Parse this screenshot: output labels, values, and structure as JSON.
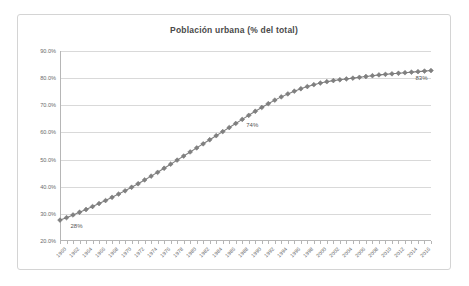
{
  "chart": {
    "title": "Población urbana (% del total)",
    "accent_color": "#808080",
    "gridline_color": "#d9d9d9",
    "frame_color": "#d4d4d4"
  },
  "chart_data": {
    "type": "line",
    "title": "Población urbana (% del total)",
    "xlabel": "",
    "ylabel": "",
    "ylim": [
      20,
      90
    ],
    "ytick_labels": [
      "20.0%",
      "30.0%",
      "40.0%",
      "50.0%",
      "60.0%",
      "70.0%",
      "80.0%",
      "90.0%"
    ],
    "ytick_values": [
      20,
      30,
      40,
      50,
      60,
      70,
      80,
      90
    ],
    "grid": true,
    "legend": "none",
    "marker": "diamond",
    "series_color": "#808080",
    "x": [
      1960,
      1961,
      1962,
      1963,
      1964,
      1965,
      1966,
      1967,
      1968,
      1969,
      1970,
      1971,
      1972,
      1973,
      1974,
      1975,
      1976,
      1977,
      1978,
      1979,
      1980,
      1981,
      1982,
      1983,
      1984,
      1985,
      1986,
      1987,
      1988,
      1989,
      1990,
      1991,
      1992,
      1993,
      1994,
      1995,
      1996,
      1997,
      1998,
      1999,
      2000,
      2001,
      2002,
      2003,
      2004,
      2005,
      2006,
      2007,
      2008,
      2009,
      2010,
      2011,
      2012,
      2013,
      2014,
      2015,
      2016,
      2017
    ],
    "values": [
      27.7,
      28.6,
      29.6,
      30.6,
      31.6,
      32.7,
      33.8,
      34.9,
      36.1,
      37.3,
      38.5,
      39.8,
      41.1,
      42.5,
      43.9,
      45.3,
      46.8,
      48.3,
      49.8,
      51.3,
      52.8,
      54.3,
      55.8,
      57.3,
      58.8,
      60.3,
      61.8,
      63.3,
      64.8,
      66.3,
      67.8,
      69.2,
      70.6,
      71.9,
      73.1,
      74.2,
      75.2,
      76.1,
      76.9,
      77.6,
      78.2,
      78.7,
      79.1,
      79.4,
      79.7,
      80.0,
      80.3,
      80.6,
      80.9,
      81.2,
      81.4,
      81.6,
      81.8,
      82.0,
      82.2,
      82.4,
      82.6,
      82.8
    ],
    "xtick_labels": [
      "1960",
      "1962",
      "1964",
      "1966",
      "1968",
      "1970",
      "1972",
      "1974",
      "1976",
      "1978",
      "1980",
      "1982",
      "1984",
      "1986",
      "1988",
      "1990",
      "1992",
      "1994",
      "1996",
      "1998",
      "2000",
      "2002",
      "2004",
      "2006",
      "2008",
      "2010",
      "2012",
      "2014",
      "2016"
    ],
    "xtick_values": [
      1960,
      1962,
      1964,
      1966,
      1968,
      1970,
      1972,
      1974,
      1976,
      1978,
      1980,
      1982,
      1984,
      1986,
      1988,
      1990,
      1992,
      1994,
      1996,
      1998,
      2000,
      2002,
      2004,
      2006,
      2008,
      2010,
      2012,
      2014,
      2016
    ],
    "annotations": [
      {
        "text": "28%",
        "x": 1961,
        "y": 27.7
      },
      {
        "text": "74%",
        "x": 1988,
        "y": 64.8
      },
      {
        "text": "83%",
        "x": 2014,
        "y": 82.2
      }
    ]
  }
}
